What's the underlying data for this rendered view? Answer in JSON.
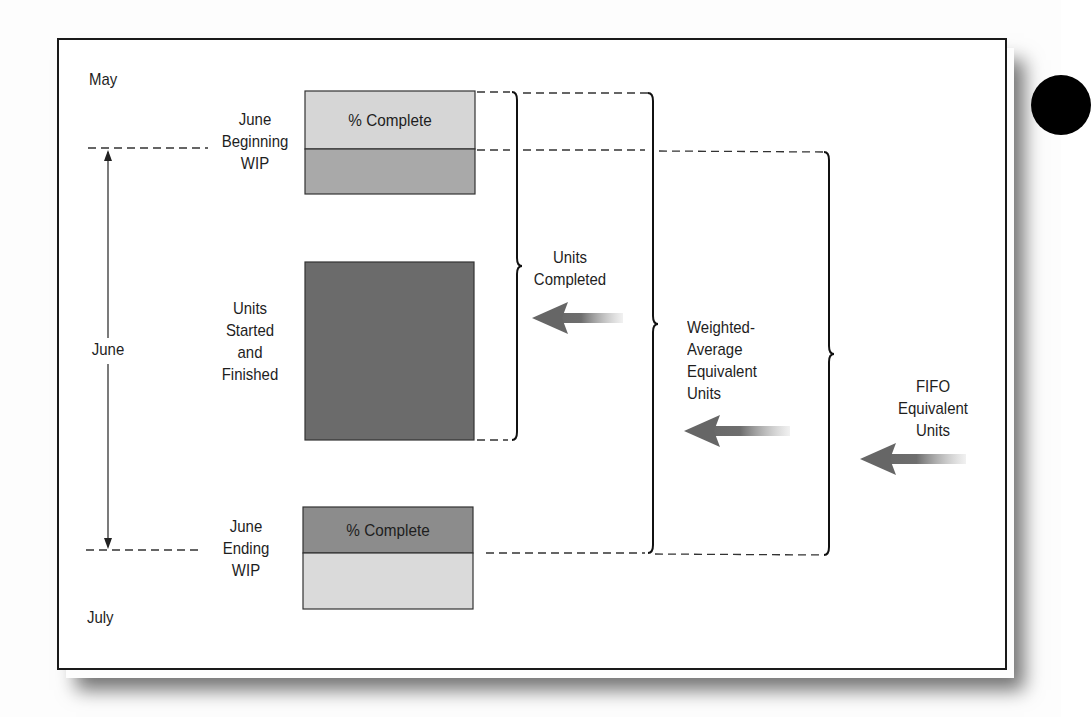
{
  "diagram": {
    "timeline": {
      "start_label": "May",
      "period_label": "June",
      "end_label": "July"
    },
    "blocks": [
      {
        "id": "beginning-wip",
        "label": "June\nBeginning\nWIP",
        "inner_text": "% Complete",
        "top_fill": "#d6d6d6",
        "bottom_fill": "#a9a9a9"
      },
      {
        "id": "started-finished",
        "label": "Units\nStarted\nand\nFinished",
        "fill": "#6b6b6b"
      },
      {
        "id": "ending-wip",
        "label": "June\nEnding\nWIP",
        "inner_text": "% Complete",
        "top_fill": "#8c8c8c",
        "bottom_fill": "#dadada"
      }
    ],
    "groups": [
      {
        "id": "units-completed",
        "label": "Units\nCompleted"
      },
      {
        "id": "weighted-average",
        "label": "Weighted-\nAverage\n  Equivalent\n      Units"
      },
      {
        "id": "fifo",
        "label": "FIFO\nEquivalent\nUnits"
      }
    ],
    "colors": {
      "frame_border": "#1a1a1a",
      "line": "#222222",
      "arrow": "#6a6a6a"
    }
  }
}
